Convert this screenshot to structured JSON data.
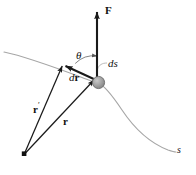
{
  "figure": {
    "kind": "physics-vector-diagram",
    "background_color": "#ffffff",
    "width": 196,
    "height": 175,
    "colors": {
      "curve": "#a6a6a6",
      "vector": "#1a1a1a",
      "node_fill": "#9a9a9a",
      "node_stroke": "#555555",
      "leader": "#b0b0b0",
      "text": "#111111"
    },
    "labels": {
      "force": "F",
      "theta": "θ",
      "arc_element": "ds",
      "displacement_d": "d",
      "displacement_r": "r",
      "position_prime": "r",
      "position_prime_mark": "′",
      "position": "r",
      "path": "s"
    },
    "geometry": {
      "origin_point": {
        "x": 24,
        "y": 154
      },
      "node_point": {
        "x": 98,
        "y": 82,
        "radius": 6
      },
      "tip_point": {
        "x": 63,
        "y": 64
      },
      "force_tip": {
        "x": 97,
        "y": 8
      },
      "force_tail": {
        "x": 97,
        "y": 82
      },
      "theta_arc_radius": 26,
      "curve_start": {
        "x": 4,
        "y": 52
      },
      "curve_end": {
        "x": 176,
        "y": 152
      }
    },
    "vectors": [
      {
        "name": "F",
        "from": "node",
        "to": "force_tip",
        "style": "bold-arrow"
      },
      {
        "name": "r-prime",
        "from": "origin",
        "to": "tip",
        "style": "thin-arrow"
      },
      {
        "name": "r",
        "from": "origin",
        "to": "node",
        "style": "thin-arrow"
      },
      {
        "name": "dr",
        "from": "node",
        "to": "tip",
        "style": "bold-arrow"
      }
    ]
  }
}
